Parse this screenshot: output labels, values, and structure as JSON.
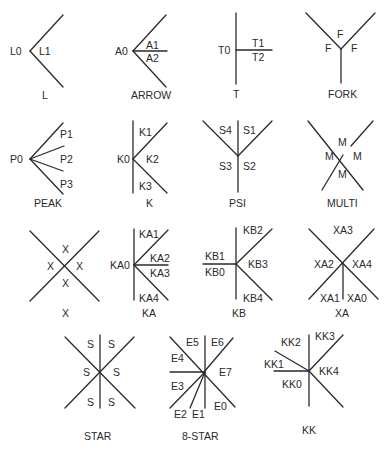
{
  "diagram": {
    "junctions": [
      {
        "name": "L",
        "caption": "L",
        "labels": [
          "L0",
          "L1"
        ]
      },
      {
        "name": "ARROW",
        "caption": "ARROW",
        "labels": [
          "A0",
          "A1",
          "A2"
        ]
      },
      {
        "name": "T",
        "caption": "T",
        "labels": [
          "T0",
          "T1",
          "T2"
        ]
      },
      {
        "name": "FORK",
        "caption": "FORK",
        "labels": [
          "F",
          "F",
          "F"
        ]
      },
      {
        "name": "PEAK",
        "caption": "PEAK",
        "labels": [
          "P0",
          "P1",
          "P2",
          "P3"
        ]
      },
      {
        "name": "K",
        "caption": "K",
        "labels": [
          "K0",
          "K1",
          "K2",
          "K3"
        ]
      },
      {
        "name": "PSI",
        "caption": "PSI",
        "labels": [
          "S1",
          "S2",
          "S3",
          "S4"
        ]
      },
      {
        "name": "MULTI",
        "caption": "MULTI",
        "labels": [
          "M",
          "M",
          "M",
          "M"
        ]
      },
      {
        "name": "X",
        "caption": "X",
        "labels": [
          "X",
          "X",
          "X",
          "X"
        ]
      },
      {
        "name": "KA",
        "caption": "KA",
        "labels": [
          "KA0",
          "KA1",
          "KA2",
          "KA3",
          "KA4"
        ]
      },
      {
        "name": "KB",
        "caption": "KB",
        "labels": [
          "KB0",
          "KB1",
          "KB2",
          "KB3",
          "KB4"
        ]
      },
      {
        "name": "XA",
        "caption": "XA",
        "labels": [
          "XA0",
          "XA1",
          "XA2",
          "XA3",
          "XA4"
        ]
      },
      {
        "name": "STAR",
        "caption": "STAR",
        "labels": [
          "S",
          "S",
          "S",
          "S",
          "S",
          "S"
        ]
      },
      {
        "name": "8-STAR",
        "caption": "8-STAR",
        "labels": [
          "E0",
          "E1",
          "E2",
          "E3",
          "E4",
          "E5",
          "E6",
          "E7"
        ]
      },
      {
        "name": "KK",
        "caption": "KK",
        "labels": [
          "KK0",
          "KK1",
          "KK2",
          "KK3",
          "KK4"
        ]
      }
    ]
  }
}
